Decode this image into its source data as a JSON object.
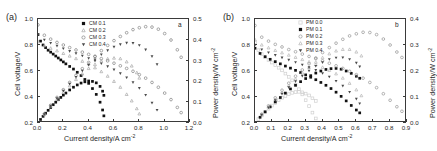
{
  "figure": {
    "panels": [
      {
        "tag": "(a)",
        "inner_tag": "a",
        "xlabel_main": "Current density/A cm",
        "xlabel_sup": "-2",
        "ylabel_left": "Cell voltage/V",
        "ylabel_right_main": "Power density/W cm",
        "ylabel_right_sup": "-2",
        "xticks": [
          "0.0",
          "0.2",
          "0.4",
          "0.6",
          "0.8",
          "1.0",
          "1.2"
        ],
        "yticks_left": [
          "0.2",
          "0.4",
          "0.6",
          "0.8",
          "1.0"
        ],
        "yticks_right": [
          "0.0",
          "0.1",
          "0.2",
          "0.3",
          "0.4",
          "0.5"
        ],
        "legend": [
          {
            "label": "CM 0.1",
            "marker": "filled-square",
            "color": "#111111"
          },
          {
            "label": "CM 0.2",
            "marker": "open-triangle-up",
            "color": "#a8a8a8"
          },
          {
            "label": "CM 0.3",
            "marker": "open-circle",
            "color": "#8a8a8a"
          },
          {
            "label": "CM 0.4",
            "marker": "filled-triangle-down",
            "color": "#4a4a4a"
          }
        ]
      },
      {
        "tag": "(b)",
        "inner_tag": "b",
        "xlabel_main": "Current density/A cm",
        "xlabel_sup": "-2",
        "ylabel_left": "Cell voltage/V",
        "ylabel_right_main": "Power density/W cm",
        "ylabel_right_sup": "-2",
        "xticks": [
          "0.0",
          "0.1",
          "0.2",
          "0.3",
          "0.4",
          "0.5",
          "0.6",
          "0.7",
          "0.8",
          "0.9"
        ],
        "yticks_left": [
          "0.2",
          "0.4",
          "0.6",
          "0.8",
          "1.0"
        ],
        "yticks_right": [
          "0.0",
          "0.1",
          "0.2",
          "0.3",
          "0.4"
        ],
        "legend": [
          {
            "label": "PM 0.0",
            "marker": "open-square",
            "color": "#cfcfcf"
          },
          {
            "label": "PM 0.1",
            "marker": "filled-square",
            "color": "#111111"
          },
          {
            "label": "PM 0.2",
            "marker": "open-circle",
            "color": "#9a9a9a"
          },
          {
            "label": "PM 0.3",
            "marker": "open-triangle-up",
            "color": "#b5b5b5"
          },
          {
            "label": "PM 0.4",
            "marker": "filled-triangle-down",
            "color": "#4a4a4a"
          }
        ]
      }
    ]
  },
  "chart_data": [
    {
      "type": "scatter",
      "title": "(a)",
      "xlabel": "Current density/A cm-2",
      "ylabel": "Cell voltage/V",
      "y2label": "Power density/W cm-2",
      "xlim": [
        0.0,
        1.2
      ],
      "ylim": [
        0.2,
        1.0
      ],
      "y2lim": [
        0.0,
        0.5
      ],
      "grid": false,
      "legend_position": "top-center",
      "series": [
        {
          "name": "CM 0.1",
          "axis": "left",
          "quantity": "cell voltage",
          "x": [
            0.0,
            0.02,
            0.04,
            0.06,
            0.08,
            0.1,
            0.12,
            0.14,
            0.16,
            0.18,
            0.2,
            0.22,
            0.25,
            0.28,
            0.31,
            0.34,
            0.37,
            0.4,
            0.43,
            0.46,
            0.49,
            0.51,
            0.52
          ],
          "y": [
            0.88,
            0.83,
            0.8,
            0.78,
            0.76,
            0.745,
            0.73,
            0.715,
            0.7,
            0.685,
            0.67,
            0.655,
            0.635,
            0.615,
            0.59,
            0.565,
            0.535,
            0.505,
            0.465,
            0.42,
            0.36,
            0.3,
            0.255
          ]
        },
        {
          "name": "CM 0.1",
          "axis": "right",
          "quantity": "power density",
          "x": [
            0.0,
            0.02,
            0.04,
            0.06,
            0.08,
            0.1,
            0.12,
            0.14,
            0.16,
            0.18,
            0.2,
            0.22,
            0.25,
            0.28,
            0.31,
            0.34,
            0.37,
            0.4,
            0.43,
            0.46,
            0.49,
            0.51,
            0.52
          ],
          "y": [
            0.0,
            0.017,
            0.032,
            0.047,
            0.061,
            0.074,
            0.088,
            0.1,
            0.112,
            0.123,
            0.134,
            0.144,
            0.159,
            0.172,
            0.183,
            0.192,
            0.198,
            0.202,
            0.2,
            0.193,
            0.176,
            0.153,
            0.133
          ]
        },
        {
          "name": "CM 0.2",
          "axis": "left",
          "quantity": "cell voltage",
          "x": [
            0.0,
            0.05,
            0.1,
            0.15,
            0.2,
            0.25,
            0.3,
            0.35,
            0.4,
            0.45,
            0.5,
            0.55,
            0.6,
            0.65,
            0.7,
            0.74,
            0.78,
            0.8
          ],
          "y": [
            0.825,
            0.795,
            0.775,
            0.755,
            0.735,
            0.715,
            0.695,
            0.675,
            0.655,
            0.625,
            0.595,
            0.56,
            0.52,
            0.475,
            0.42,
            0.37,
            0.31,
            0.27
          ]
        },
        {
          "name": "CM 0.2",
          "axis": "right",
          "quantity": "power density",
          "x": [
            0.0,
            0.05,
            0.1,
            0.15,
            0.2,
            0.25,
            0.3,
            0.35,
            0.4,
            0.45,
            0.5,
            0.55,
            0.6,
            0.65,
            0.7,
            0.74,
            0.78,
            0.8
          ],
          "y": [
            0.0,
            0.04,
            0.078,
            0.113,
            0.147,
            0.179,
            0.209,
            0.236,
            0.262,
            0.281,
            0.298,
            0.308,
            0.312,
            0.309,
            0.294,
            0.274,
            0.242,
            0.216
          ]
        },
        {
          "name": "CM 0.3",
          "axis": "left",
          "quantity": "cell voltage",
          "x": [
            0.0,
            0.05,
            0.1,
            0.15,
            0.2,
            0.25,
            0.3,
            0.35,
            0.4,
            0.45,
            0.5,
            0.55,
            0.6,
            0.65,
            0.7,
            0.75,
            0.8,
            0.85,
            0.9,
            0.95,
            1.0,
            1.05,
            1.1,
            1.13
          ],
          "y": [
            0.955,
            0.875,
            0.845,
            0.82,
            0.8,
            0.78,
            0.762,
            0.745,
            0.728,
            0.712,
            0.695,
            0.678,
            0.66,
            0.64,
            0.62,
            0.598,
            0.572,
            0.545,
            0.512,
            0.475,
            0.43,
            0.38,
            0.32,
            0.28
          ]
        },
        {
          "name": "CM 0.3",
          "axis": "right",
          "quantity": "power density",
          "x": [
            0.0,
            0.05,
            0.1,
            0.15,
            0.2,
            0.25,
            0.3,
            0.35,
            0.4,
            0.45,
            0.5,
            0.55,
            0.6,
            0.65,
            0.7,
            0.75,
            0.8,
            0.85,
            0.9,
            0.95,
            1.0,
            1.05,
            1.1,
            1.13
          ],
          "y": [
            0.0,
            0.044,
            0.085,
            0.123,
            0.16,
            0.195,
            0.229,
            0.261,
            0.291,
            0.32,
            0.348,
            0.373,
            0.396,
            0.416,
            0.434,
            0.449,
            0.458,
            0.463,
            0.461,
            0.451,
            0.43,
            0.399,
            0.352,
            0.316
          ]
        },
        {
          "name": "CM 0.4",
          "axis": "left",
          "quantity": "cell voltage",
          "x": [
            0.0,
            0.05,
            0.1,
            0.15,
            0.2,
            0.25,
            0.3,
            0.35,
            0.4,
            0.45,
            0.5,
            0.55,
            0.6,
            0.65,
            0.7,
            0.75,
            0.8,
            0.85,
            0.9,
            0.94
          ],
          "y": [
            0.88,
            0.84,
            0.815,
            0.793,
            0.773,
            0.753,
            0.735,
            0.717,
            0.698,
            0.678,
            0.658,
            0.635,
            0.61,
            0.582,
            0.55,
            0.512,
            0.468,
            0.415,
            0.355,
            0.3
          ]
        },
        {
          "name": "CM 0.4",
          "axis": "right",
          "quantity": "power density",
          "x": [
            0.0,
            0.05,
            0.1,
            0.15,
            0.2,
            0.25,
            0.3,
            0.35,
            0.4,
            0.45,
            0.5,
            0.55,
            0.6,
            0.65,
            0.7,
            0.75,
            0.8,
            0.85,
            0.9,
            0.94
          ],
          "y": [
            0.0,
            0.042,
            0.082,
            0.119,
            0.155,
            0.188,
            0.221,
            0.251,
            0.279,
            0.305,
            0.329,
            0.349,
            0.366,
            0.378,
            0.385,
            0.384,
            0.374,
            0.353,
            0.32,
            0.282
          ]
        }
      ]
    },
    {
      "type": "scatter",
      "title": "(b)",
      "xlabel": "Current density/A cm-2",
      "ylabel": "Cell voltage/V",
      "y2label": "Power density/W cm-2",
      "xlim": [
        0.0,
        0.9
      ],
      "ylim": [
        0.2,
        1.0
      ],
      "y2lim": [
        0.0,
        0.4
      ],
      "grid": false,
      "legend_position": "top-center",
      "series": [
        {
          "name": "PM 0.0",
          "axis": "left",
          "quantity": "cell voltage",
          "x": [
            0.0,
            0.02,
            0.04,
            0.06,
            0.08,
            0.1,
            0.12,
            0.14,
            0.16,
            0.18,
            0.2,
            0.22,
            0.24,
            0.26,
            0.28,
            0.3,
            0.32,
            0.34,
            0.36
          ],
          "y": [
            0.82,
            0.76,
            0.73,
            0.705,
            0.685,
            0.665,
            0.645,
            0.625,
            0.605,
            0.58,
            0.555,
            0.528,
            0.495,
            0.46,
            0.42,
            0.375,
            0.33,
            0.28,
            0.235
          ]
        },
        {
          "name": "PM 0.0",
          "axis": "right",
          "quantity": "power density",
          "x": [
            0.0,
            0.02,
            0.04,
            0.06,
            0.08,
            0.1,
            0.12,
            0.14,
            0.16,
            0.18,
            0.2,
            0.22,
            0.24,
            0.26,
            0.28,
            0.3,
            0.32,
            0.34,
            0.36
          ],
          "y": [
            0.0,
            0.015,
            0.029,
            0.042,
            0.055,
            0.067,
            0.077,
            0.088,
            0.097,
            0.104,
            0.111,
            0.116,
            0.119,
            0.12,
            0.118,
            0.113,
            0.106,
            0.095,
            0.085
          ]
        },
        {
          "name": "PM 0.1",
          "axis": "left",
          "quantity": "cell voltage",
          "x": [
            0.0,
            0.03,
            0.06,
            0.09,
            0.12,
            0.15,
            0.18,
            0.21,
            0.24,
            0.27,
            0.3,
            0.33,
            0.36,
            0.39,
            0.42,
            0.45,
            0.48,
            0.51,
            0.54,
            0.57,
            0.6,
            0.62
          ],
          "y": [
            0.775,
            0.735,
            0.71,
            0.69,
            0.672,
            0.655,
            0.638,
            0.622,
            0.605,
            0.588,
            0.57,
            0.552,
            0.533,
            0.512,
            0.49,
            0.465,
            0.437,
            0.405,
            0.37,
            0.335,
            0.3,
            0.278
          ]
        },
        {
          "name": "PM 0.1",
          "axis": "right",
          "quantity": "power density",
          "x": [
            0.0,
            0.03,
            0.06,
            0.09,
            0.12,
            0.15,
            0.18,
            0.21,
            0.24,
            0.27,
            0.3,
            0.33,
            0.36,
            0.39,
            0.42,
            0.45,
            0.48,
            0.51,
            0.54,
            0.57,
            0.6,
            0.62
          ],
          "y": [
            0.0,
            0.022,
            0.043,
            0.062,
            0.081,
            0.098,
            0.115,
            0.131,
            0.145,
            0.159,
            0.171,
            0.182,
            0.192,
            0.2,
            0.206,
            0.209,
            0.21,
            0.207,
            0.2,
            0.191,
            0.18,
            0.172
          ]
        },
        {
          "name": "PM 0.2",
          "axis": "left",
          "quantity": "cell voltage",
          "x": [
            0.0,
            0.04,
            0.08,
            0.12,
            0.16,
            0.2,
            0.24,
            0.28,
            0.32,
            0.36,
            0.4,
            0.44,
            0.48,
            0.52,
            0.56,
            0.6,
            0.64,
            0.68,
            0.72,
            0.76,
            0.8,
            0.84,
            0.87
          ],
          "y": [
            0.95,
            0.86,
            0.83,
            0.805,
            0.785,
            0.765,
            0.748,
            0.73,
            0.712,
            0.695,
            0.678,
            0.66,
            0.64,
            0.62,
            0.598,
            0.572,
            0.545,
            0.512,
            0.472,
            0.425,
            0.375,
            0.325,
            0.29
          ]
        },
        {
          "name": "PM 0.2",
          "axis": "right",
          "quantity": "power density",
          "x": [
            0.0,
            0.04,
            0.08,
            0.12,
            0.16,
            0.2,
            0.24,
            0.28,
            0.32,
            0.36,
            0.4,
            0.44,
            0.48,
            0.52,
            0.56,
            0.6,
            0.64,
            0.68,
            0.72,
            0.76,
            0.8,
            0.84,
            0.87
          ],
          "y": [
            0.0,
            0.034,
            0.066,
            0.097,
            0.126,
            0.153,
            0.18,
            0.204,
            0.228,
            0.25,
            0.271,
            0.29,
            0.307,
            0.322,
            0.335,
            0.343,
            0.349,
            0.348,
            0.34,
            0.323,
            0.3,
            0.273,
            0.252
          ]
        },
        {
          "name": "PM 0.3",
          "axis": "left",
          "quantity": "cell voltage",
          "x": [
            0.0,
            0.04,
            0.08,
            0.12,
            0.16,
            0.2,
            0.24,
            0.28,
            0.32,
            0.36,
            0.4,
            0.44,
            0.48,
            0.52,
            0.56,
            0.6,
            0.63
          ],
          "y": [
            0.84,
            0.8,
            0.778,
            0.758,
            0.74,
            0.722,
            0.705,
            0.688,
            0.67,
            0.65,
            0.628,
            0.605,
            0.578,
            0.545,
            0.505,
            0.455,
            0.41
          ]
        },
        {
          "name": "PM 0.3",
          "axis": "right",
          "quantity": "power density",
          "x": [
            0.0,
            0.04,
            0.08,
            0.12,
            0.16,
            0.2,
            0.24,
            0.28,
            0.32,
            0.36,
            0.4,
            0.44,
            0.48,
            0.52,
            0.56,
            0.6,
            0.63
          ],
          "y": [
            0.0,
            0.032,
            0.062,
            0.091,
            0.118,
            0.144,
            0.169,
            0.193,
            0.214,
            0.234,
            0.251,
            0.266,
            0.277,
            0.283,
            0.283,
            0.273,
            0.258
          ]
        },
        {
          "name": "PM 0.4",
          "axis": "left",
          "quantity": "cell voltage",
          "x": [
            0.0,
            0.04,
            0.08,
            0.12,
            0.16,
            0.2,
            0.24,
            0.28,
            0.32,
            0.36,
            0.4,
            0.44,
            0.48,
            0.52,
            0.56,
            0.6,
            0.62
          ],
          "y": [
            0.8,
            0.765,
            0.742,
            0.722,
            0.703,
            0.685,
            0.667,
            0.648,
            0.628,
            0.607,
            0.583,
            0.556,
            0.523,
            0.485,
            0.438,
            0.385,
            0.35
          ]
        },
        {
          "name": "PM 0.4",
          "axis": "right",
          "quantity": "power density",
          "x": [
            0.0,
            0.04,
            0.08,
            0.12,
            0.16,
            0.2,
            0.24,
            0.28,
            0.32,
            0.36,
            0.4,
            0.44,
            0.48,
            0.52,
            0.56,
            0.6,
            0.62
          ],
          "y": [
            0.0,
            0.031,
            0.059,
            0.087,
            0.112,
            0.137,
            0.16,
            0.181,
            0.201,
            0.219,
            0.233,
            0.245,
            0.251,
            0.252,
            0.245,
            0.231,
            0.217
          ]
        }
      ]
    }
  ]
}
